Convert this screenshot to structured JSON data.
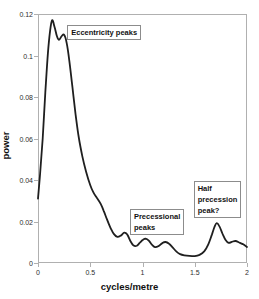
{
  "chart_data": {
    "type": "line",
    "title": "",
    "xlabel": "cycles/metre",
    "ylabel": "power",
    "xlim": [
      0,
      2
    ],
    "ylim": [
      0,
      0.12
    ],
    "grid": false,
    "legend": "none",
    "frame_color": "#b0b0b0",
    "curve_color": "#1f1f1f",
    "x_ticks": [
      {
        "v": 0,
        "label": "0"
      },
      {
        "v": 0.5,
        "label": "0.5"
      },
      {
        "v": 1,
        "label": "1"
      },
      {
        "v": 1.5,
        "label": "1.5"
      },
      {
        "v": 2,
        "label": "2"
      }
    ],
    "y_ticks": [
      {
        "v": 0,
        "label": "0"
      },
      {
        "v": 0.02,
        "label": "0.02"
      },
      {
        "v": 0.04,
        "label": "0.04"
      },
      {
        "v": 0.06,
        "label": "0.06"
      },
      {
        "v": 0.08,
        "label": "0.08"
      },
      {
        "v": 0.1,
        "label": "0.1"
      },
      {
        "v": 0.12,
        "label": "0.12"
      }
    ],
    "series": [
      {
        "name": "power spectrum",
        "points": [
          [
            0,
            0.031
          ],
          [
            0.02,
            0.043
          ],
          [
            0.045,
            0.06
          ],
          [
            0.07,
            0.082
          ],
          [
            0.095,
            0.101
          ],
          [
            0.115,
            0.1115
          ],
          [
            0.135,
            0.117
          ],
          [
            0.16,
            0.1135
          ],
          [
            0.18,
            0.1095
          ],
          [
            0.2,
            0.1075
          ],
          [
            0.225,
            0.1092
          ],
          [
            0.25,
            0.11
          ],
          [
            0.275,
            0.106
          ],
          [
            0.3,
            0.0975
          ],
          [
            0.33,
            0.0845
          ],
          [
            0.36,
            0.0715
          ],
          [
            0.39,
            0.0605
          ],
          [
            0.425,
            0.0513
          ],
          [
            0.46,
            0.044
          ],
          [
            0.5,
            0.0375
          ],
          [
            0.53,
            0.034
          ],
          [
            0.565,
            0.0313
          ],
          [
            0.6,
            0.0285
          ],
          [
            0.63,
            0.025
          ],
          [
            0.66,
            0.021
          ],
          [
            0.695,
            0.0168
          ],
          [
            0.725,
            0.014
          ],
          [
            0.76,
            0.0126
          ],
          [
            0.795,
            0.0133
          ],
          [
            0.825,
            0.0146
          ],
          [
            0.855,
            0.0137
          ],
          [
            0.885,
            0.0105
          ],
          [
            0.915,
            0.0084
          ],
          [
            0.945,
            0.0083
          ],
          [
            0.975,
            0.0098
          ],
          [
            1.005,
            0.0112
          ],
          [
            1.03,
            0.0117
          ],
          [
            1.06,
            0.0108
          ],
          [
            1.09,
            0.0088
          ],
          [
            1.12,
            0.0076
          ],
          [
            1.155,
            0.0082
          ],
          [
            1.19,
            0.0096
          ],
          [
            1.22,
            0.0101
          ],
          [
            1.255,
            0.0093
          ],
          [
            1.29,
            0.0074
          ],
          [
            1.325,
            0.0055
          ],
          [
            1.36,
            0.0043
          ],
          [
            1.4,
            0.0037
          ],
          [
            1.45,
            0.0034
          ],
          [
            1.5,
            0.0033
          ],
          [
            1.545,
            0.0039
          ],
          [
            1.59,
            0.0056
          ],
          [
            1.63,
            0.009
          ],
          [
            1.665,
            0.0138
          ],
          [
            1.69,
            0.0175
          ],
          [
            1.71,
            0.0192
          ],
          [
            1.735,
            0.0178
          ],
          [
            1.765,
            0.0142
          ],
          [
            1.795,
            0.0111
          ],
          [
            1.825,
            0.0097
          ],
          [
            1.855,
            0.0102
          ],
          [
            1.89,
            0.0106
          ],
          [
            1.925,
            0.0099
          ],
          [
            1.96,
            0.0091
          ],
          [
            2.0,
            0.0077
          ]
        ]
      }
    ],
    "annotations": [
      {
        "id": "eccentricity-peaks",
        "text": "Eccentricity peaks",
        "x": 0.28,
        "y": 0.1147
      },
      {
        "id": "precessional-peaks",
        "text": "Precessional\npeaks",
        "x": 0.88,
        "y": 0.026
      },
      {
        "id": "half-precession-peak",
        "text": "Half\nprecession\npeak?",
        "x": 1.49,
        "y": 0.0395
      }
    ]
  }
}
